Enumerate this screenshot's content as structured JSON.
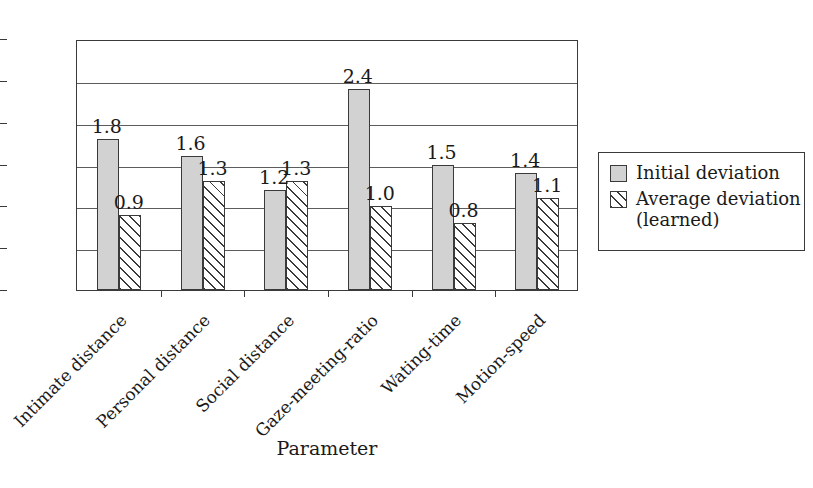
{
  "chart_data": {
    "type": "bar",
    "title": "",
    "subtitle": "",
    "xlabel": "Parameter",
    "ylabel": "",
    "ylim": [
      0,
      3
    ],
    "ytick_labels": [
      "0",
      "0.5",
      "1",
      "1.5",
      "2",
      "2.5",
      "3"
    ],
    "ytick_values": [
      0,
      0.5,
      1,
      1.5,
      2,
      2.5,
      3
    ],
    "grid": "horizontal",
    "legend_position": "right",
    "categories": [
      "Intimate distance",
      "Personal distance",
      "Social distance",
      "Gaze-meeting-ratio",
      "Wating-time",
      "Motion-speed"
    ],
    "series": [
      {
        "name": "Initial deviation",
        "values": [
          1.8,
          1.6,
          1.2,
          2.4,
          1.5,
          1.4
        ],
        "value_labels": [
          "1.8",
          "1.6",
          "1.2",
          "2.4",
          "1.5",
          "1.4"
        ],
        "fill": "#d2d2d2",
        "pattern": "solid"
      },
      {
        "name": "Average deviation (learned)",
        "values": [
          0.9,
          1.3,
          1.3,
          1.0,
          0.8,
          1.1
        ],
        "value_labels": [
          "0.9",
          "1.3",
          "1.3",
          "1.0",
          "0.8",
          "1.1"
        ],
        "fill": "#ffffff",
        "pattern": "diagonal-hatch"
      }
    ]
  },
  "legend": {
    "entries": [
      {
        "label": "Initial deviation",
        "swatch": "solid-gray-square-icon"
      },
      {
        "label": "Average deviation\n(learned)",
        "swatch": "hatched-square-icon"
      }
    ],
    "entry_0_label": "Initial deviation",
    "entry_1_label_line1": "Average deviation",
    "entry_1_label_line2": "(learned)"
  },
  "axis": {
    "x_title": "Parameter"
  },
  "colors": {
    "series_initial": "#d2d2d2",
    "series_average": "#ffffff",
    "outline": "#3a3a3a",
    "gridline": "#5c5c5c",
    "text": "#1a1a1a",
    "background": "#ffffff"
  }
}
